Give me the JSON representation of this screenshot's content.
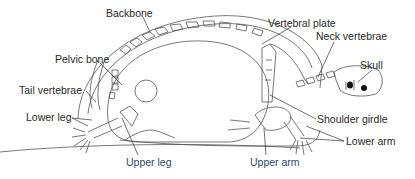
{
  "diagram": {
    "labels": [
      {
        "id": "backbone",
        "text": "Backbone",
        "x": 106,
        "y": 7
      },
      {
        "id": "vertebral_plate",
        "text": "Vertebral plate",
        "x": 268,
        "y": 17
      },
      {
        "id": "neck_vertebrae",
        "text": "Neck vertebrae",
        "x": 316,
        "y": 30
      },
      {
        "id": "skull",
        "text": "Skull",
        "x": 360,
        "y": 59
      },
      {
        "id": "pelvic_bone",
        "text": "Pelvic bone",
        "x": 55,
        "y": 53
      },
      {
        "id": "tail_vertebrae",
        "text": "Tail vertebrae",
        "x": 19,
        "y": 84
      },
      {
        "id": "lower_leg",
        "text": "Lower leg",
        "x": 26,
        "y": 111
      },
      {
        "id": "upper_leg",
        "text": "Upper leg",
        "x": 126,
        "y": 156
      },
      {
        "id": "shoulder_girdle",
        "text": "Shoulder girdle",
        "x": 317,
        "y": 113
      },
      {
        "id": "lower_arm",
        "text": "Lower arm",
        "x": 346,
        "y": 135
      },
      {
        "id": "upper_arm",
        "text": "Upper arm",
        "x": 250,
        "y": 156
      }
    ]
  }
}
